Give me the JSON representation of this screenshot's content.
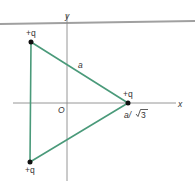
{
  "diagram": {
    "type": "charge-configuration",
    "axes": {
      "x_label": "x",
      "y_label": "y",
      "origin_label": "O"
    },
    "charges": [
      {
        "label": "+q",
        "position": "top-left"
      },
      {
        "label": "+q",
        "position": "right-on-x-axis"
      },
      {
        "label": "+q",
        "position": "bottom-left"
      }
    ],
    "side_label": "a",
    "distance_label_prefix": "a/",
    "distance_label_radicand": "3",
    "colors": {
      "triangle": "#4a9a7a",
      "axes": "#888888",
      "charge": "#111111",
      "top_band": "#9a9a9a"
    }
  }
}
